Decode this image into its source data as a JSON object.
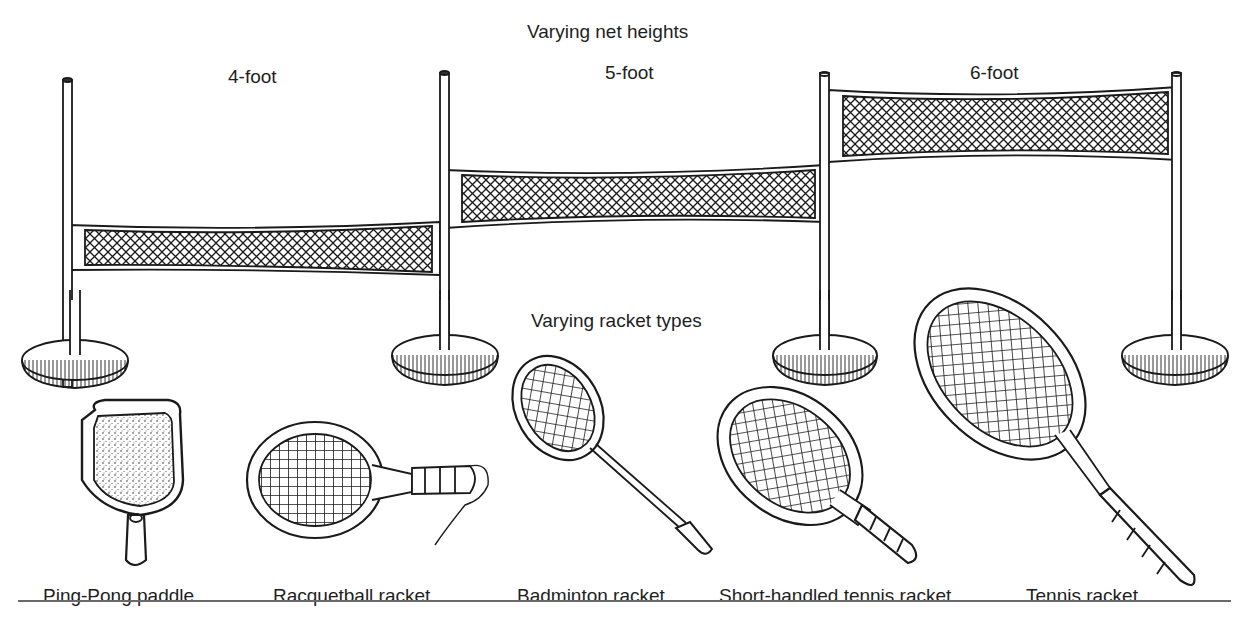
{
  "figure": {
    "nets_title": "Varying net heights",
    "rackets_title": "Varying racket types",
    "nets": [
      {
        "label": "4-foot"
      },
      {
        "label": "5-foot"
      },
      {
        "label": "6-foot"
      }
    ],
    "rackets": [
      {
        "label": "Ping-Pong paddle"
      },
      {
        "label": "Racquetball racket"
      },
      {
        "label": "Badminton racket"
      },
      {
        "label": "Short-handled tennis racket"
      },
      {
        "label": "Tennis racket"
      }
    ],
    "colors": {
      "ink": "#1a1a1a",
      "paper": "#ffffff",
      "rule": "#6a6a6a"
    }
  }
}
